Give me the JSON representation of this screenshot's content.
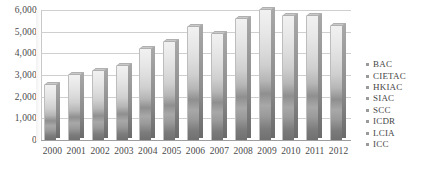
{
  "chart_data": {
    "type": "bar",
    "title": "",
    "subtitle": "",
    "xlabel": "",
    "ylabel": "",
    "categories": [
      "2000",
      "2001",
      "2002",
      "2003",
      "2004",
      "2005",
      "2006",
      "2007",
      "2008",
      "2009",
      "2010",
      "2011",
      "2012"
    ],
    "values": [
      2600,
      3050,
      3250,
      3450,
      4250,
      4550,
      5250,
      4950,
      5650,
      6050,
      5750,
      5750,
      5300
    ],
    "series": [
      {
        "name": "Total caseload",
        "values": [
          2600,
          3050,
          3250,
          3450,
          4250,
          4550,
          5250,
          4950,
          5650,
          6050,
          5750,
          5750,
          5300
        ]
      }
    ],
    "ylim": [
      0,
      6000
    ],
    "yticks": [
      0,
      1000,
      2000,
      3000,
      4000,
      5000,
      6000
    ],
    "ytick_labels": [
      "0",
      "1,000",
      "2,000",
      "3,000",
      "4,000",
      "5,000",
      "6,000"
    ],
    "grid": true,
    "legend_position": "right",
    "legend": [
      "BAC",
      "CIETAC",
      "HKIAC",
      "SIAC",
      "SCC",
      "ICDR",
      "LCIA",
      "ICC"
    ],
    "style": "3d-stacked-column-grayscale",
    "annotations": []
  },
  "axes": {
    "y_ticks": [
      {
        "label": "6,000",
        "value": 6000
      },
      {
        "label": "5,000",
        "value": 5000
      },
      {
        "label": "4,000",
        "value": 4000
      },
      {
        "label": "3,000",
        "value": 3000
      },
      {
        "label": "2,000",
        "value": 2000
      },
      {
        "label": "1,000",
        "value": 1000
      },
      {
        "label": "0",
        "value": 0
      }
    ],
    "x_ticks": [
      {
        "label": "2000"
      },
      {
        "label": "2001"
      },
      {
        "label": "2002"
      },
      {
        "label": "2003"
      },
      {
        "label": "2004"
      },
      {
        "label": "2005"
      },
      {
        "label": "2006"
      },
      {
        "label": "2007"
      },
      {
        "label": "2008"
      },
      {
        "label": "2009"
      },
      {
        "label": "2010"
      },
      {
        "label": "2011"
      },
      {
        "label": "2012"
      }
    ]
  },
  "legend": {
    "items": [
      {
        "label": "BAC",
        "color": "#9a9a9a"
      },
      {
        "label": "CIETAC",
        "color": "#9a9a9a"
      },
      {
        "label": "HKIAC",
        "color": "#9a9a9a"
      },
      {
        "label": "SIAC",
        "color": "#9a9a9a"
      },
      {
        "label": "SCC",
        "color": "#9a9a9a"
      },
      {
        "label": "ICDR",
        "color": "#9a9a9a"
      },
      {
        "label": "LCIA",
        "color": "#9a9a9a"
      },
      {
        "label": "ICC",
        "color": "#9a9a9a"
      }
    ]
  },
  "colors": {
    "background": "#ffffff",
    "gridline": "#cfcfcf",
    "axis": "#9e9e9e",
    "text": "#454545",
    "bar_bottom": "#6f6f6f",
    "bar_top": "#f1f1f1"
  }
}
